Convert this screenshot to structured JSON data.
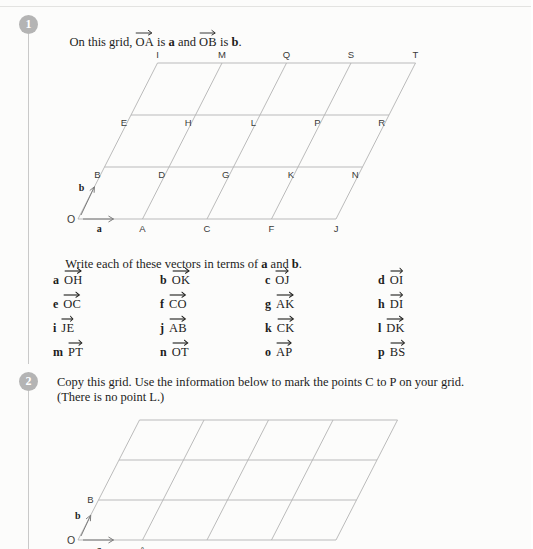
{
  "page": {
    "background": "#fcfcfb",
    "line_color": "#b3b3b3",
    "text_color": "#1d1d1b",
    "badge_color": "#b4b4b4"
  },
  "questions": [
    {
      "number": "1",
      "text_lines": [
        "On this grid,  OA  is a and  OB  is b."
      ],
      "prompt_parts": {
        "lead": "On this grid,",
        "vec1": "OA",
        "mid": "is",
        "bold1": "a",
        "and": "and",
        "vec2": "OB",
        "mid2": "is",
        "bold2": "b",
        "end": "."
      }
    },
    {
      "number": "2",
      "text_lines": [
        "Copy this grid. Use the information below to mark the points C to P on your grid.",
        "(There is no point L.)"
      ]
    }
  ],
  "instruction": {
    "lead": "Write each of these vectors in terms of",
    "bold1": "a",
    "and": "and",
    "bold2": "b",
    "end": "."
  },
  "vector_list": {
    "columns_x": [
      53,
      160,
      265,
      378
    ],
    "rows_y": [
      272,
      296,
      320,
      344
    ],
    "items": [
      {
        "letter": "a",
        "vector": "OH",
        "col": 0,
        "row": 0
      },
      {
        "letter": "b",
        "vector": "OK",
        "col": 1,
        "row": 0
      },
      {
        "letter": "c",
        "vector": "OJ",
        "col": 2,
        "row": 0
      },
      {
        "letter": "d",
        "vector": "OI",
        "col": 3,
        "row": 0
      },
      {
        "letter": "e",
        "vector": "OC",
        "col": 0,
        "row": 1
      },
      {
        "letter": "f",
        "vector": "CO",
        "col": 1,
        "row": 1
      },
      {
        "letter": "g",
        "vector": "AK",
        "col": 2,
        "row": 1
      },
      {
        "letter": "h",
        "vector": "DI",
        "col": 3,
        "row": 1
      },
      {
        "letter": "i",
        "vector": "JE",
        "col": 0,
        "row": 2
      },
      {
        "letter": "j",
        "vector": "AB",
        "col": 1,
        "row": 2
      },
      {
        "letter": "k",
        "vector": "CK",
        "col": 2,
        "row": 2
      },
      {
        "letter": "l",
        "vector": "DK",
        "col": 3,
        "row": 2
      },
      {
        "letter": "m",
        "vector": "PT",
        "col": 0,
        "row": 3
      },
      {
        "letter": "n",
        "vector": "OT",
        "col": 1,
        "row": 3
      },
      {
        "letter": "o",
        "vector": "AP",
        "col": 2,
        "row": 3
      },
      {
        "letter": "p",
        "vector": "BS",
        "col": 3,
        "row": 3
      }
    ]
  },
  "grid1": {
    "origin_x": 78,
    "origin_y": 219,
    "step_x": 64.5,
    "row_height": 52,
    "shear_x": 26.5,
    "cols": 4,
    "rows": 3,
    "arrow_a_label": "a",
    "arrow_b_label": "b",
    "origin_label": "O",
    "point_labels": [
      [
        "A",
        "C",
        "F",
        "J"
      ],
      [
        "B",
        "D",
        "G",
        "K",
        "N"
      ],
      [
        "E",
        "H",
        "L",
        "P",
        "R"
      ],
      [
        "I",
        "M",
        "Q",
        "S",
        "T"
      ]
    ],
    "row0_labels": [
      "A",
      "C",
      "F",
      "J"
    ],
    "row1_labels": [
      "B",
      "D",
      "G",
      "K",
      "N"
    ],
    "row2_labels": [
      "E",
      "H",
      "L",
      "P",
      "R"
    ],
    "row3_labels": [
      "I",
      "M",
      "Q",
      "S",
      "T"
    ]
  },
  "grid2": {
    "origin_x": 78,
    "origin_y": 540,
    "step_x": 64.5,
    "row_height": 40,
    "shear_x": 20.5,
    "cols": 4,
    "rows": 3,
    "arrow_a_label": "a",
    "arrow_b_label": "b",
    "origin_label": "O",
    "point_a_label": "A",
    "point_b_label": "B"
  }
}
